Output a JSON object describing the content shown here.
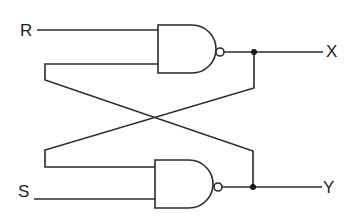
{
  "diagram": {
    "type": "SR latch (cross-coupled NAND gates)",
    "inputs": [
      {
        "label": "R"
      },
      {
        "label": "S"
      }
    ],
    "outputs": [
      {
        "label": "X"
      },
      {
        "label": "Y"
      }
    ],
    "gates": [
      {
        "name": "top-nand",
        "kind": "NAND"
      },
      {
        "name": "bottom-nand",
        "kind": "NAND"
      }
    ],
    "colors": {
      "line": "#2a2a2a",
      "background": "#ffffff"
    }
  }
}
